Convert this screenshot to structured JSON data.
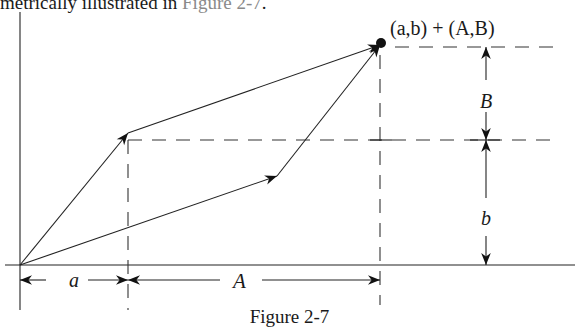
{
  "text_above": {
    "prefix": "metrically illustrated in ",
    "link": "Figure 2-7",
    "suffix": "."
  },
  "diagram": {
    "sum_label": "(a,b) + (A,B)",
    "labels": {
      "a": "a",
      "A": "A",
      "B": "B",
      "b": "b"
    },
    "vectors": [
      {
        "name": "(a,b)",
        "from": [
          0,
          0
        ],
        "to": [
          "a",
          "b"
        ]
      },
      {
        "name": "(A,B)",
        "from": [
          0,
          0
        ],
        "to": [
          "A",
          "B"
        ]
      },
      {
        "name": "(A,B) translated",
        "from": [
          "a",
          "b"
        ],
        "to": [
          "a+A",
          "b+B"
        ]
      },
      {
        "name": "(a,b) translated",
        "from": [
          "A",
          "B"
        ],
        "to": [
          "a+A",
          "b+B"
        ]
      }
    ]
  },
  "caption": "Figure 2-7"
}
